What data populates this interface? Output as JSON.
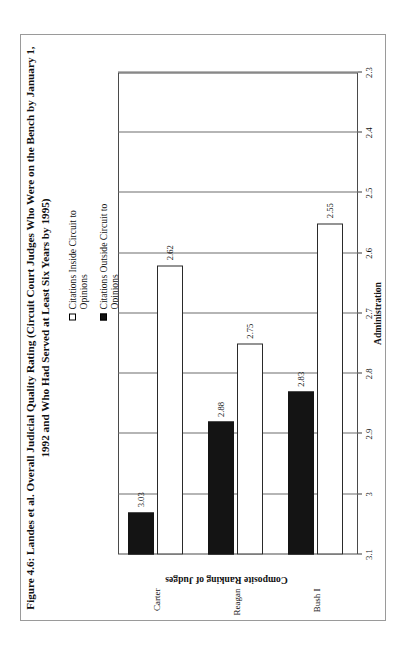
{
  "figure": {
    "title": "Figure 4.6: Landes et al. Overall Judicial Quality Rating (Circuit Court Judges Who Were on the Bench by January 1, 1992 and Who Had Served at Least Six Years by 1995)",
    "orientation_note": "figure rotated 90 degrees on page"
  },
  "legend": {
    "items": [
      {
        "label": "Citations Inside Circuit to Opinions",
        "marker": "open-square-icon",
        "color": "#ffffff"
      },
      {
        "label": "Citations Outside Circuit to Opinions",
        "marker": "filled-square-icon",
        "color": "#141414"
      }
    ]
  },
  "axes": {
    "value_axis_title": "Composite Ranking of Judges",
    "category_axis_title": "Administration",
    "tick_labels": [
      "3.1",
      "3",
      "2.9",
      "2.8",
      "2.7",
      "2.6",
      "2.5",
      "2.4",
      "2.3"
    ]
  },
  "chart_data": {
    "type": "bar",
    "orientation": "horizontal",
    "title": "Figure 4.6: Landes et al. Overall Judicial Quality Rating (Circuit Court Judges Who Were on the Bench by January 1, 1992 and Who Had Served at Least Six Years by 1995)",
    "xlabel": "Administration",
    "ylabel": "Composite Ranking of Judges",
    "categories": [
      "Carter",
      "Reagan",
      "Bush I"
    ],
    "series": [
      {
        "name": "Citations Outside Circuit to Opinions",
        "color": "#141414",
        "values": [
          3.03,
          2.88,
          2.83
        ],
        "labels": [
          "3.03",
          "2.88",
          "2.83"
        ]
      },
      {
        "name": "Citations Inside Circuit to Opinions",
        "color": "#ffffff",
        "values": [
          2.62,
          2.75,
          2.55
        ],
        "labels": [
          "2.62",
          "2.75",
          "2.55"
        ]
      }
    ],
    "ylim": [
      2.3,
      3.1
    ],
    "tick_values": [
      3.1,
      3.0,
      2.9,
      2.8,
      2.7,
      2.6,
      2.5,
      2.4,
      2.3
    ],
    "tick_labels": [
      "3.1",
      "3",
      "2.9",
      "2.8",
      "2.7",
      "2.6",
      "2.5",
      "2.4",
      "2.3"
    ],
    "grid": true,
    "legend_position": "top-right"
  }
}
